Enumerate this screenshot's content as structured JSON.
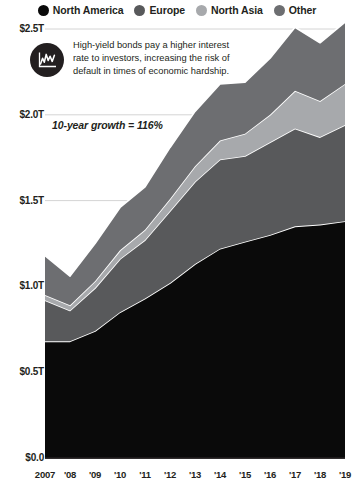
{
  "legend": {
    "items": [
      {
        "label": "North America",
        "color": "#0a0a0a",
        "icon": "legend-dot-icon"
      },
      {
        "label": "Europe",
        "color": "#58595b",
        "icon": "legend-dot-icon"
      },
      {
        "label": "North Asia",
        "color": "#a7a9ac",
        "icon": "legend-dot-icon"
      },
      {
        "label": "Other",
        "color": "#6d6e71",
        "icon": "legend-dot-icon"
      }
    ]
  },
  "callout": {
    "icon": "line-chart-icon",
    "text": "High-yield bonds pay a higher interest rate to investors, increasing the risk of default in times of economic hardship."
  },
  "growth_note": "10-year growth = 116%",
  "chart_data": {
    "type": "area",
    "stacked": true,
    "title": "",
    "xlabel": "",
    "ylabel": "",
    "grid": true,
    "legend_position": "top",
    "ylim": [
      0,
      2.5
    ],
    "yticks": [
      0,
      0.5,
      1.0,
      1.5,
      2.0,
      2.5
    ],
    "ytick_labels": [
      "$0.0",
      "$0.5T",
      "$1.0T",
      "$1.5T",
      "$2.0T",
      "$2.5T"
    ],
    "categories": [
      "2007",
      "'08",
      "'09",
      "'10",
      "'11",
      "'12",
      "'13",
      "'14",
      "'15",
      "'16",
      "'17",
      "'18",
      "'19"
    ],
    "x_full": [
      2007,
      2008,
      2009,
      2010,
      2011,
      2012,
      2013,
      2014,
      2015,
      2016,
      2017,
      2018,
      2019
    ],
    "series": [
      {
        "name": "North America",
        "color": "#0a0a0a",
        "values": [
          0.68,
          0.68,
          0.74,
          0.85,
          0.93,
          1.02,
          1.13,
          1.22,
          1.26,
          1.3,
          1.35,
          1.36,
          1.38
        ]
      },
      {
        "name": "Europe",
        "color": "#58595b",
        "values": [
          0.24,
          0.18,
          0.25,
          0.31,
          0.34,
          0.42,
          0.48,
          0.52,
          0.5,
          0.54,
          0.57,
          0.51,
          0.56
        ]
      },
      {
        "name": "North Asia",
        "color": "#a7a9ac",
        "values": [
          0.03,
          0.03,
          0.04,
          0.05,
          0.06,
          0.07,
          0.09,
          0.11,
          0.13,
          0.16,
          0.22,
          0.21,
          0.24
        ]
      },
      {
        "name": "Other",
        "color": "#6d6e71",
        "values": [
          0.23,
          0.17,
          0.22,
          0.25,
          0.25,
          0.3,
          0.32,
          0.33,
          0.3,
          0.33,
          0.37,
          0.34,
          0.36
        ]
      }
    ],
    "totals": [
      1.18,
      1.06,
      1.25,
      1.46,
      1.58,
      1.81,
      2.02,
      2.18,
      2.19,
      2.33,
      2.51,
      2.42,
      2.54
    ],
    "annotations": [
      {
        "text": "10-year growth = 116%"
      },
      {
        "text": "High-yield bonds pay a higher interest rate to investors, increasing the risk of default in times of economic hardship."
      }
    ]
  }
}
